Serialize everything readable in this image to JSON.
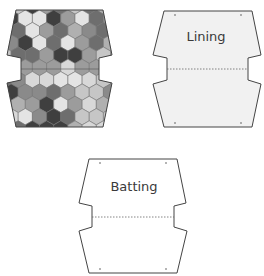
{
  "diagram": {
    "pieces": [
      {
        "id": "outer-patchwork",
        "label": "",
        "fill": "hexagon-patchwork",
        "points": [
          [
            16,
            10
          ],
          [
            103,
            10
          ],
          [
            112,
            55
          ],
          [
            99,
            58
          ],
          [
            99,
            80
          ],
          [
            112,
            83
          ],
          [
            103,
            127
          ],
          [
            16,
            127
          ],
          [
            7,
            83
          ],
          [
            21,
            80
          ],
          [
            21,
            58
          ],
          [
            7,
            55
          ]
        ],
        "fold_line_y": 69,
        "corner_marks": []
      },
      {
        "id": "lining",
        "label": "Lining",
        "label_pos": [
          206,
          36
        ],
        "fill": "#f1f1f1",
        "points": [
          [
            164,
            11
          ],
          [
            252,
            11
          ],
          [
            261,
            55
          ],
          [
            248,
            58
          ],
          [
            248,
            80
          ],
          [
            261,
            84
          ],
          [
            252,
            127
          ],
          [
            164,
            127
          ],
          [
            153,
            84
          ],
          [
            167,
            80
          ],
          [
            167,
            58
          ],
          [
            153,
            55
          ]
        ],
        "fold_line_y": 69,
        "corner_marks": [
          [
            175,
            15
          ],
          [
            241,
            15
          ],
          [
            175,
            123
          ],
          [
            241,
            123
          ]
        ]
      },
      {
        "id": "batting",
        "label": "Batting",
        "label_pos": [
          134,
          186
        ],
        "fill": "#ffffff",
        "points": [
          [
            89,
            159
          ],
          [
            177,
            159
          ],
          [
            186,
            203
          ],
          [
            174,
            206
          ],
          [
            174,
            227
          ],
          [
            187,
            231
          ],
          [
            177,
            273
          ],
          [
            89,
            273
          ],
          [
            79,
            231
          ],
          [
            92,
            227
          ],
          [
            92,
            206
          ],
          [
            79,
            203
          ]
        ],
        "fold_line_y": 217,
        "corner_marks": [
          [
            100,
            163
          ],
          [
            166,
            163
          ],
          [
            100,
            269
          ],
          [
            166,
            269
          ]
        ]
      }
    ],
    "hex_palette": [
      "#3f3f3f",
      "#6e6e6e",
      "#8a8a8a",
      "#9c9c9c",
      "#b0b0b0",
      "#c6c6c6",
      "#d8d8d8",
      "#e4e4e4"
    ],
    "stroke_color": "#444444"
  }
}
